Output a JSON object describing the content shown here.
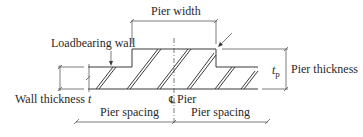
{
  "diagram": {
    "type": "plan-section",
    "labels": {
      "pier_width": "Pier width",
      "loadbearing_wall": "Loadbearing wall",
      "pier_thickness_symbol": "t",
      "pier_thickness_subscript": "p",
      "pier_thickness": "Pier thickness",
      "wall_thickness": "Wall thickness ",
      "wall_thickness_symbol": "t",
      "centerline_symbol": "℄",
      "pier": "Pier",
      "pier_spacing_left": "Pier spacing",
      "pier_spacing_right": "Pier spacing"
    },
    "colors": {
      "line": "#3a3a3a",
      "text": "#2a2a2a",
      "background": "#ffffff"
    }
  }
}
